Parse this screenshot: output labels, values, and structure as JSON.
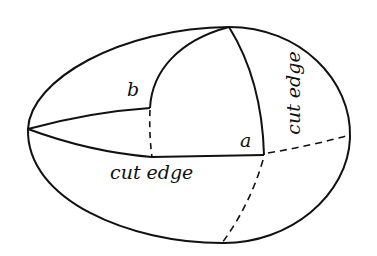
{
  "diagram": {
    "type": "geometric-surface-cutting",
    "labels": {
      "b": "b",
      "a": "a",
      "cut_edge_bottom": "cut edge",
      "cut_edge_right": "cut edge"
    },
    "colors": {
      "stroke": "#111111",
      "background": "#ffffff"
    },
    "points": {
      "left_tip": [
        28,
        129
      ],
      "top": [
        229,
        27
      ],
      "corner_b": [
        150,
        108
      ],
      "corner_a": [
        264,
        155
      ],
      "right_end": [
        350,
        135
      ],
      "bottom_end": [
        222,
        243
      ]
    }
  }
}
